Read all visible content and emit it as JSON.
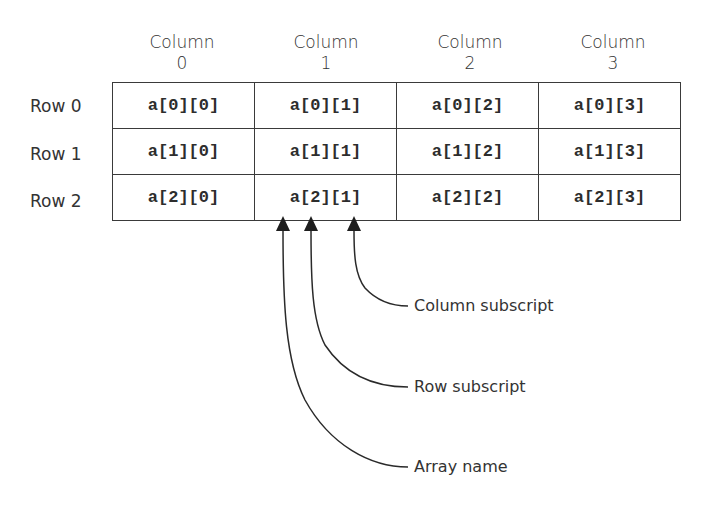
{
  "diagram": {
    "column_headers": [
      {
        "label": "Column",
        "index": "0"
      },
      {
        "label": "Column",
        "index": "1"
      },
      {
        "label": "Column",
        "index": "2"
      },
      {
        "label": "Column",
        "index": "3"
      }
    ],
    "row_labels": [
      "Row 0",
      "Row 1",
      "Row 2"
    ],
    "cells": [
      [
        "a[0][0]",
        "a[0][1]",
        "a[0][2]",
        "a[0][3]"
      ],
      [
        "a[1][0]",
        "a[1][1]",
        "a[1][2]",
        "a[1][3]"
      ],
      [
        "a[2][0]",
        "a[2][1]",
        "a[2][2]",
        "a[2][3]"
      ]
    ],
    "callouts": {
      "column_subscript": "Column subscript",
      "row_subscript": "Row subscript",
      "array_name": "Array name"
    },
    "annotated_cell": "a[2][1]",
    "colors": {
      "line": "#3a3a3a",
      "text": "#2d2d2d",
      "background": "#ffffff"
    }
  }
}
